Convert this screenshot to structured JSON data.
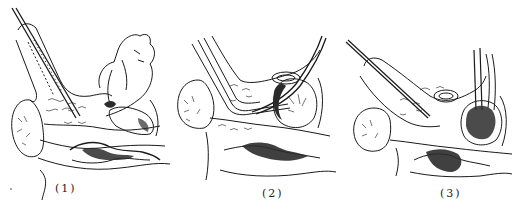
{
  "figure": {
    "panels": [
      {
        "id": 1,
        "label": "(1)"
      },
      {
        "id": 2,
        "label": "(2)"
      },
      {
        "id": 3,
        "label": "(3)"
      }
    ],
    "colors": {
      "background": "#ffffff",
      "ink": "#1a1a1a",
      "shade": "#2b2b2b"
    }
  }
}
